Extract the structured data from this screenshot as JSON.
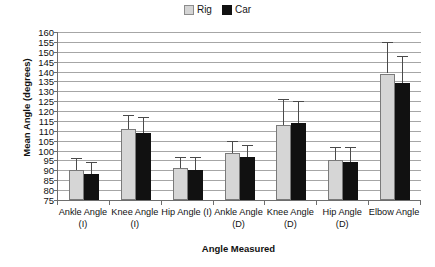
{
  "chart_data": {
    "type": "bar",
    "title": "",
    "xlabel": "Angle Measured",
    "ylabel": "Mean Angle (degrees)",
    "categories": [
      "Ankle Angle (I)",
      "Knee Angle (I)",
      "Hip Angle (I)",
      "Ankle Angle (D)",
      "Knee Angle (D)",
      "Hip Angle (D)",
      "Elbow Angle"
    ],
    "series": [
      {
        "name": "Rig",
        "color": "#d6d6d6",
        "values": [
          90,
          111,
          91,
          99,
          113,
          95,
          139
        ],
        "errors_upper": [
          96,
          118,
          97,
          105,
          126,
          102,
          155
        ],
        "errors_lower": [
          84,
          104,
          85,
          93,
          100,
          88,
          123
        ]
      },
      {
        "name": "Car",
        "color": "#111111",
        "values": [
          88,
          109,
          90,
          97,
          114,
          94,
          134
        ],
        "errors_upper": [
          94,
          117,
          97,
          103,
          125,
          102,
          148
        ],
        "errors_lower": [
          82,
          101,
          83,
          91,
          103,
          86,
          120
        ]
      }
    ],
    "ylim": [
      75,
      160
    ],
    "ytick_step": 5,
    "ytick_labels": [
      "160",
      "155",
      "150",
      "145",
      "140",
      "135",
      "130",
      "125",
      "120",
      "115",
      "110",
      "105",
      "100",
      "95",
      "90",
      "85",
      "80",
      "75"
    ],
    "grid": true,
    "legend_position": "top-center"
  },
  "legend": {
    "entries": [
      {
        "label": "Rig",
        "icon": "square-light-gray-swatch"
      },
      {
        "label": "Car",
        "icon": "square-black-swatch"
      }
    ]
  }
}
